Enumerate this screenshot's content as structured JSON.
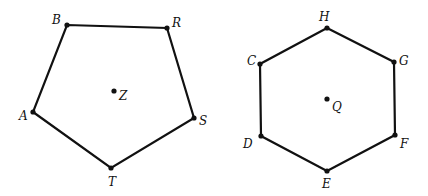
{
  "figures": [
    {
      "name": "pentagon",
      "center": {
        "label": "Z",
        "x": 114,
        "y": 91,
        "lx": 119,
        "ly": 100
      },
      "vertices": [
        {
          "label": "B",
          "x": 67,
          "y": 25,
          "lx": 52,
          "ly": 24
        },
        {
          "label": "R",
          "x": 167,
          "y": 28,
          "lx": 172,
          "ly": 27
        },
        {
          "label": "S",
          "x": 194,
          "y": 118,
          "lx": 199,
          "ly": 125
        },
        {
          "label": "T",
          "x": 111,
          "y": 168,
          "lx": 108,
          "ly": 186
        },
        {
          "label": "A",
          "x": 33,
          "y": 112,
          "lx": 19,
          "ly": 120
        }
      ]
    },
    {
      "name": "hexagon",
      "center": {
        "label": "Q",
        "x": 327,
        "y": 99,
        "lx": 332,
        "ly": 111
      },
      "vertices": [
        {
          "label": "H",
          "x": 327,
          "y": 28,
          "lx": 319,
          "ly": 21
        },
        {
          "label": "G",
          "x": 394,
          "y": 62,
          "lx": 399,
          "ly": 65
        },
        {
          "label": "F",
          "x": 395,
          "y": 135,
          "lx": 400,
          "ly": 148
        },
        {
          "label": "E",
          "x": 327,
          "y": 171,
          "lx": 322,
          "ly": 188
        },
        {
          "label": "D",
          "x": 261,
          "y": 136,
          "lx": 243,
          "ly": 148
        },
        {
          "label": "C",
          "x": 260,
          "y": 64,
          "lx": 247,
          "ly": 65
        }
      ]
    }
  ]
}
